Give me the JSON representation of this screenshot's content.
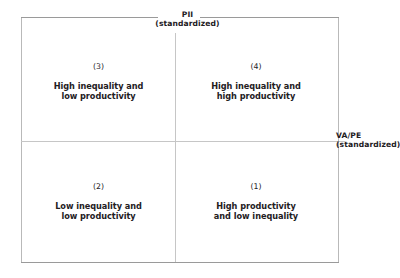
{
  "figure": {
    "axes": {
      "vertical": {
        "name": "PII",
        "qualifier": "(standardized)"
      },
      "horizontal": {
        "name": "VA/PE",
        "qualifier": "(standardized)"
      }
    },
    "quadrants": [
      {
        "position": "top-left",
        "number": "(3)",
        "line1": "High inequality and",
        "line2": "low productivity"
      },
      {
        "position": "top-right",
        "number": "(4)",
        "line1": "High inequality and",
        "line2": "high productivity"
      },
      {
        "position": "bottom-left",
        "number": "(2)",
        "line1": "Low inequality and",
        "line2": "low productivity"
      },
      {
        "position": "bottom-right",
        "number": "(1)",
        "line1": "High productivity",
        "line2": "and low inequality"
      }
    ],
    "colors": {
      "frame": "#9a9a9a",
      "axis": "#c6c6c6",
      "text": "#23201e",
      "background": "#ffffff"
    }
  }
}
